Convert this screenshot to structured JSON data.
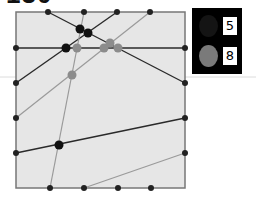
{
  "title": "130",
  "colors": {
    "board_fill": "#e6e6e6",
    "border": "#777777",
    "dark": "#1a1a1a",
    "gray": "#8a8a8a",
    "legend_bg": "#000000"
  },
  "board": {
    "x0": 16,
    "y0": 12,
    "x1": 185,
    "y1": 188,
    "edge_dots": [
      [
        48,
        12
      ],
      [
        84,
        12
      ],
      [
        117,
        12
      ],
      [
        150,
        12
      ],
      [
        185,
        48
      ],
      [
        185,
        83
      ],
      [
        185,
        118
      ],
      [
        185,
        153
      ],
      [
        50,
        188
      ],
      [
        84,
        188
      ],
      [
        118,
        188
      ],
      [
        151,
        188
      ],
      [
        16,
        48
      ],
      [
        16,
        83
      ],
      [
        16,
        118
      ],
      [
        16,
        153
      ]
    ],
    "lines": [
      {
        "color": "dark",
        "from": [
          48,
          12
        ],
        "to": [
          185,
          83
        ]
      },
      {
        "color": "dark",
        "from": [
          16,
          83
        ],
        "to": [
          117,
          12
        ]
      },
      {
        "color": "dark",
        "from": [
          16,
          48
        ],
        "to": [
          185,
          48
        ]
      },
      {
        "color": "dark",
        "from": [
          16,
          153
        ],
        "to": [
          185,
          118
        ]
      },
      {
        "color": "gray",
        "from": [
          150,
          12
        ],
        "to": [
          16,
          118
        ]
      },
      {
        "color": "gray",
        "from": [
          84,
          12
        ],
        "to": [
          50,
          188
        ]
      },
      {
        "color": "gray",
        "from": [
          84,
          188
        ],
        "to": [
          185,
          153
        ]
      }
    ],
    "intersections": [
      {
        "color": "dark",
        "at": [
          80,
          29
        ]
      },
      {
        "color": "dark",
        "at": [
          88,
          33
        ]
      },
      {
        "color": "dark",
        "at": [
          66,
          48
        ]
      },
      {
        "color": "dark",
        "at": [
          59,
          145
        ]
      },
      {
        "color": "gray",
        "at": [
          77,
          48
        ]
      },
      {
        "color": "gray",
        "at": [
          104,
          48
        ]
      },
      {
        "color": "gray",
        "at": [
          110,
          43
        ]
      },
      {
        "color": "gray",
        "at": [
          118,
          48
        ]
      },
      {
        "color": "gray",
        "at": [
          72,
          75
        ]
      }
    ]
  },
  "legend": {
    "dark_count": "5",
    "gray_count": "8"
  }
}
